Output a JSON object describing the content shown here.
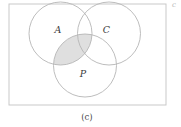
{
  "figure": {
    "caption": "(c)",
    "corner_mark": "c",
    "universe_box": {
      "x": 9,
      "y": 4,
      "width": 157,
      "height": 101,
      "stroke": "#c9c9c9"
    },
    "sets": [
      {
        "id": "A",
        "label": "A",
        "cx": 60.5,
        "cy": 33.5,
        "r": 31.5,
        "label_x": 58,
        "label_y": 30,
        "stroke": "#b5b5b5"
      },
      {
        "id": "C",
        "label": "C",
        "cx": 109,
        "cy": 33.5,
        "r": 31.5,
        "label_x": 106.5,
        "label_y": 30.5,
        "stroke": "#b5b5b5"
      },
      {
        "id": "P",
        "label": "P",
        "cx": 85,
        "cy": 65.5,
        "r": 31.5,
        "label_x": 83,
        "label_y": 74,
        "stroke": "#b5b5b5"
      }
    ],
    "shaded_region": {
      "name": "A-intersect-P",
      "description": "intersection of set A and set P",
      "fill": "#d9d9d9",
      "opacity": 0.85
    },
    "colors": {
      "background": "#ffffff",
      "circle_stroke": "#b5b5b5",
      "box_stroke": "#c9c9c9",
      "label_text": "#3a3a3a",
      "caption_text": "#4a4a4a",
      "shade_fill": "#d9d9d9"
    },
    "caption_x": 87,
    "caption_y": 117,
    "corner_mark_x": 174,
    "corner_mark_y": 5
  }
}
